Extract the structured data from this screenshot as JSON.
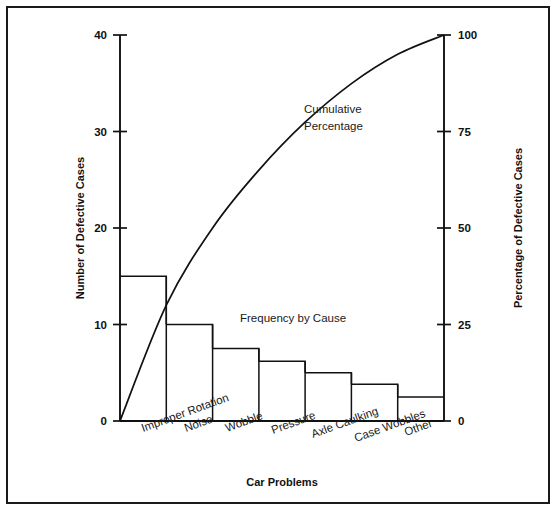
{
  "chart_data": {
    "type": "bar",
    "title": "",
    "subtitle": "",
    "categories": [
      "Improper Rotation",
      "Noise",
      "Wobble",
      "Pressure",
      "Axle Caulking",
      "Case Wobbles",
      "Other"
    ],
    "values": [
      15,
      10,
      7.5,
      6.2,
      5,
      3.8,
      2.5
    ],
    "cumulative_percentages": [
      30,
      50,
      65,
      77.4,
      87.4,
      95,
      100
    ],
    "series": [
      {
        "name": "Frequency by Cause",
        "type": "bar",
        "values": [
          15,
          10,
          7.5,
          6.2,
          5,
          3.8,
          2.5
        ]
      },
      {
        "name": "Cumulative Percentage",
        "type": "line",
        "values": [
          30,
          50,
          65,
          77.4,
          87.4,
          95,
          100
        ]
      }
    ],
    "xlabel": "Car Problems",
    "ylabel": "Number of Defective Cases",
    "y2label": "Percentage of Defective Cases",
    "ylim": [
      0,
      40
    ],
    "y2lim": [
      0,
      100
    ],
    "yticks": [
      "0",
      "10",
      "20",
      "30",
      "40"
    ],
    "ytick_values": [
      0,
      10,
      20,
      30,
      40
    ],
    "y2ticks": [
      "0",
      "25",
      "50",
      "75",
      "100"
    ],
    "y2tick_values": [
      0,
      25,
      50,
      75,
      100
    ],
    "grid": false,
    "legend": "none",
    "annotations": [
      {
        "text_line1": "Cumulative",
        "text_line2": "Percentage"
      },
      {
        "text": "Frequency by Cause"
      }
    ],
    "colors": {
      "line": "#111111",
      "bar_stroke": "#111111",
      "bar_fill": "none",
      "frame": "#1a1a1a"
    }
  },
  "axes": {
    "left_title": "Number of Defective Cases",
    "right_title": "Percentage of Defective Cases",
    "bottom_title": "Car Problems"
  },
  "annotations": {
    "cumulative_line1": "Cumulative",
    "cumulative_line2": "Percentage",
    "frequency": "Frequency by Cause"
  }
}
